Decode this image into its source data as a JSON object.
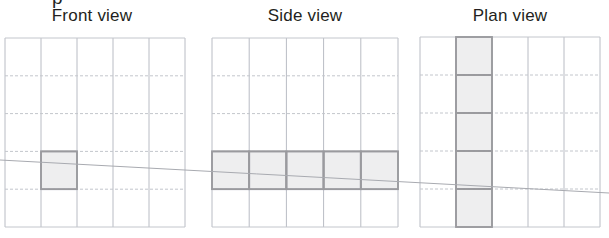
{
  "document": {
    "kind": "orthographic-projection-diagram",
    "clipped_text_above": "p"
  },
  "views": [
    {
      "id": "front",
      "title": "Front view",
      "title_center_x": 92,
      "title_y": 6,
      "grid": {
        "x": 5,
        "y": 38,
        "cols": 5,
        "rows": 5,
        "cell_w": 36,
        "cell_h": 37.8
      },
      "shaded_cells": [
        {
          "col": 2,
          "row": 4
        }
      ]
    },
    {
      "id": "side",
      "title": "Side view",
      "title_center_x": 305,
      "title_y": 6,
      "grid": {
        "x": 212,
        "y": 38,
        "cols": 5,
        "rows": 5,
        "cell_w": 37.2,
        "cell_h": 37.8
      },
      "shaded_cells": [
        {
          "col": 1,
          "row": 4
        },
        {
          "col": 2,
          "row": 4
        },
        {
          "col": 3,
          "row": 4
        },
        {
          "col": 4,
          "row": 4
        },
        {
          "col": 5,
          "row": 4
        }
      ]
    },
    {
      "id": "plan",
      "title": "Plan view",
      "title_center_x": 510,
      "title_y": 6,
      "grid": {
        "x": 420,
        "y": 37,
        "cols": 5,
        "rows": 5,
        "cell_w": 36,
        "cell_h": 38
      },
      "shaded_cells": [
        {
          "col": 2,
          "row": 1
        },
        {
          "col": 2,
          "row": 2
        },
        {
          "col": 2,
          "row": 3
        },
        {
          "col": 2,
          "row": 4
        },
        {
          "col": 2,
          "row": 5
        }
      ]
    }
  ],
  "sightline": {
    "label": "projection-sight-line",
    "x1": 0,
    "y1": 160,
    "x2": 609,
    "y2": 193
  },
  "colors": {
    "title_text": "#231f20",
    "grid_line": "#b9bcc4",
    "grid_line_dashed": "#c3c6cc",
    "shade_fill": "#eeeeef",
    "shade_border": "#9a9a9e",
    "sightline": "#a8aab0",
    "background": "#ffffff"
  }
}
